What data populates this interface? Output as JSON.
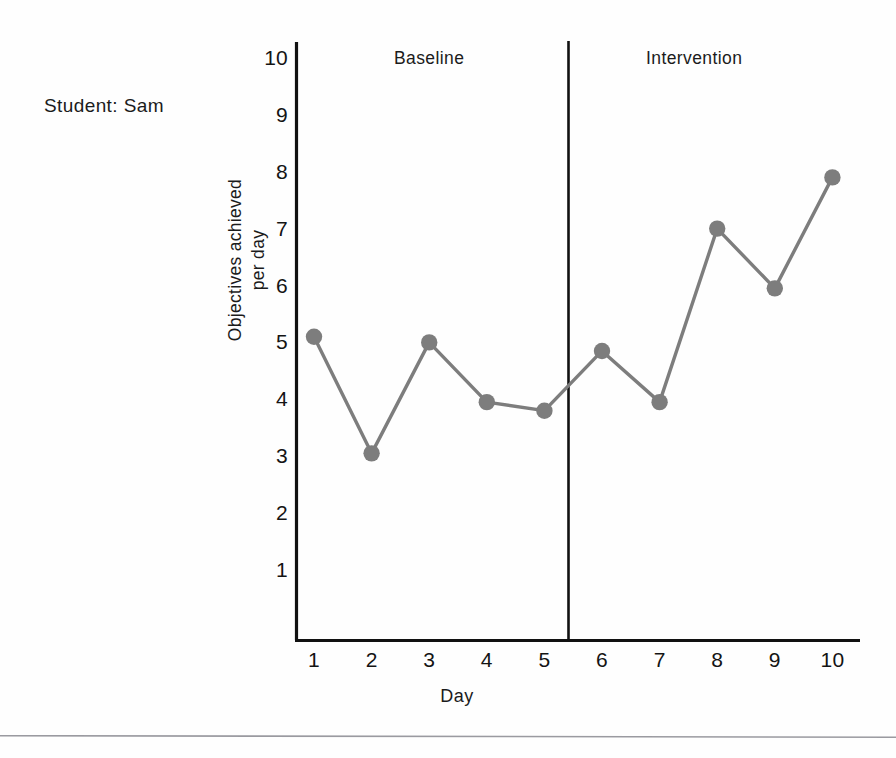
{
  "figure": {
    "student_label": "Student: Sam",
    "line_color": "#7d7d7d",
    "marker_color": "#7d7d7d",
    "axis_color": "#111111"
  },
  "chart_data": {
    "type": "line",
    "title": "",
    "subtitle": "",
    "xlabel": "Day",
    "ylabel": "Objectives achieved per day",
    "ylabel_line1": "Objectives achieved",
    "ylabel_line2": "per day",
    "x": [
      1,
      2,
      3,
      4,
      5,
      6,
      7,
      8,
      9,
      10
    ],
    "categories": [
      "1",
      "2",
      "3",
      "4",
      "5",
      "6",
      "7",
      "8",
      "9",
      "10"
    ],
    "values": [
      5.1,
      3.05,
      5.0,
      3.95,
      3.8,
      4.85,
      3.95,
      7.0,
      5.95,
      7.9
    ],
    "series": [
      {
        "name": "Objectives achieved per day",
        "values": [
          5.1,
          3.05,
          5.0,
          3.95,
          3.8,
          4.85,
          3.95,
          7.0,
          5.95,
          7.9
        ]
      }
    ],
    "xlim": [
      0.55,
      10.5
    ],
    "ylim": [
      0,
      10.35
    ],
    "yticks": [
      1,
      2,
      3,
      4,
      5,
      6,
      7,
      8,
      9,
      10
    ],
    "ytick_labels": [
      "1",
      "2",
      "3",
      "4",
      "5",
      "6",
      "7",
      "8",
      "9",
      "10"
    ],
    "xticks": [
      1,
      2,
      3,
      4,
      5,
      6,
      7,
      8,
      9,
      10
    ],
    "xtick_labels": [
      "1",
      "2",
      "3",
      "4",
      "5",
      "6",
      "7",
      "8",
      "9",
      "10"
    ],
    "grid": false,
    "legend": "none",
    "phase_line": {
      "at_x": 5.42,
      "label": "phase-change-line"
    },
    "annotations": [
      {
        "text": "Baseline",
        "x": 3.0,
        "position": "top-left-panel"
      },
      {
        "text": "Intervention",
        "x": 7.6,
        "position": "top-right-panel"
      }
    ],
    "phases": [
      {
        "label": "Baseline",
        "days": [
          1,
          2,
          3,
          4,
          5
        ]
      },
      {
        "label": "Intervention",
        "days": [
          6,
          7,
          8,
          9,
          10
        ]
      }
    ]
  }
}
